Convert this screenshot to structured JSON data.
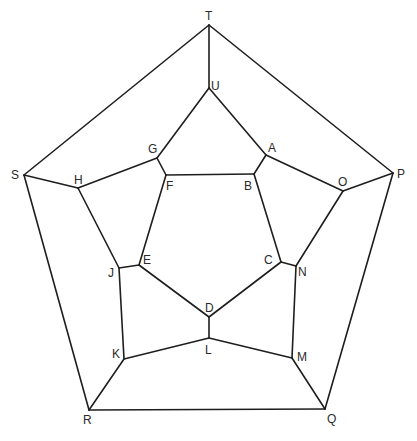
{
  "diagram": {
    "type": "graph",
    "colors": {
      "line": "#1e1e1e",
      "label": "#2a2a2a",
      "background": "#ffffff"
    },
    "vertices": [
      {
        "id": "T",
        "x": 209,
        "y": 25,
        "lx": 205,
        "ly": 20
      },
      {
        "id": "U",
        "x": 209,
        "y": 88,
        "lx": 211,
        "ly": 90
      },
      {
        "id": "S",
        "x": 24,
        "y": 175,
        "lx": 11,
        "ly": 179
      },
      {
        "id": "P",
        "x": 393,
        "y": 173,
        "lx": 397,
        "ly": 178
      },
      {
        "id": "R",
        "x": 89,
        "y": 410,
        "lx": 83,
        "ly": 424
      },
      {
        "id": "Q",
        "x": 325,
        "y": 409,
        "lx": 327,
        "ly": 423
      },
      {
        "id": "G",
        "x": 157,
        "y": 158,
        "lx": 148,
        "ly": 153
      },
      {
        "id": "A",
        "x": 266,
        "y": 155,
        "lx": 268,
        "ly": 152
      },
      {
        "id": "H",
        "x": 78,
        "y": 188,
        "lx": 74,
        "ly": 184
      },
      {
        "id": "O",
        "x": 343,
        "y": 191,
        "lx": 338,
        "ly": 186
      },
      {
        "id": "F",
        "x": 166,
        "y": 175,
        "lx": 166,
        "ly": 190
      },
      {
        "id": "B",
        "x": 254,
        "y": 174,
        "lx": 244,
        "ly": 190
      },
      {
        "id": "E",
        "x": 139,
        "y": 265,
        "lx": 143,
        "ly": 264
      },
      {
        "id": "C",
        "x": 281,
        "y": 262,
        "lx": 264,
        "ly": 264
      },
      {
        "id": "J",
        "x": 119,
        "y": 268,
        "lx": 108,
        "ly": 277
      },
      {
        "id": "N",
        "x": 296,
        "y": 266,
        "lx": 298,
        "ly": 276
      },
      {
        "id": "D",
        "x": 209,
        "y": 317,
        "lx": 205,
        "ly": 312
      },
      {
        "id": "L",
        "x": 209,
        "y": 338,
        "lx": 205,
        "ly": 354
      },
      {
        "id": "K",
        "x": 124,
        "y": 359,
        "lx": 112,
        "ly": 358
      },
      {
        "id": "M",
        "x": 292,
        "y": 358,
        "lx": 297,
        "ly": 361
      }
    ],
    "edges": [
      [
        "T",
        "S"
      ],
      [
        "T",
        "P"
      ],
      [
        "S",
        "R"
      ],
      [
        "P",
        "Q"
      ],
      [
        "R",
        "Q"
      ],
      [
        "T",
        "U"
      ],
      [
        "S",
        "H"
      ],
      [
        "P",
        "O"
      ],
      [
        "R",
        "K"
      ],
      [
        "Q",
        "M"
      ],
      [
        "U",
        "G"
      ],
      [
        "G",
        "H"
      ],
      [
        "H",
        "J"
      ],
      [
        "J",
        "K"
      ],
      [
        "K",
        "L"
      ],
      [
        "L",
        "M"
      ],
      [
        "M",
        "N"
      ],
      [
        "N",
        "O"
      ],
      [
        "O",
        "A"
      ],
      [
        "A",
        "U"
      ],
      [
        "G",
        "F"
      ],
      [
        "J",
        "E"
      ],
      [
        "L",
        "D"
      ],
      [
        "N",
        "C"
      ],
      [
        "A",
        "B"
      ],
      [
        "F",
        "B"
      ],
      [
        "B",
        "C"
      ],
      [
        "C",
        "D"
      ],
      [
        "D",
        "E"
      ],
      [
        "E",
        "F"
      ]
    ]
  }
}
